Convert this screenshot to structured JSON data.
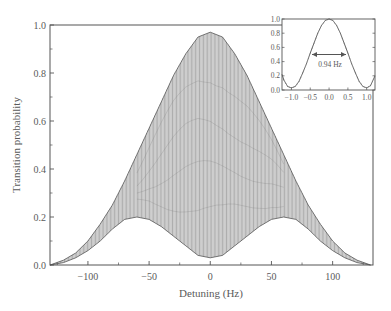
{
  "chart_data": [
    {
      "id": "main",
      "type": "line",
      "title": "",
      "xlabel": "Detuning (Hz)",
      "ylabel": "Transition probability",
      "xlim": [
        -131,
        133
      ],
      "ylim": [
        0.0,
        1.0
      ],
      "xticks": [
        -100,
        -50,
        0,
        50,
        100
      ],
      "xtick_labels": [
        "−100",
        "−50",
        "0",
        "50",
        "100"
      ],
      "yticks": [
        0.0,
        0.2,
        0.4,
        0.6,
        0.8,
        1.0
      ],
      "ytick_labels": [
        "0.0",
        "0.2",
        "0.4",
        "0.6",
        "0.8",
        "1.0"
      ],
      "grid": false,
      "legend": null,
      "description": "Rapidly oscillating transition probability between an upper and lower envelope",
      "upper_envelope": {
        "x": [
          -131,
          -120,
          -110,
          -100,
          -90,
          -80,
          -70,
          -60,
          -50,
          -40,
          -30,
          -20,
          -10,
          0,
          10,
          20,
          30,
          40,
          50,
          60,
          70,
          80,
          90,
          100,
          110,
          120,
          131
        ],
        "y": [
          0.0,
          0.02,
          0.05,
          0.1,
          0.17,
          0.25,
          0.35,
          0.46,
          0.57,
          0.68,
          0.79,
          0.88,
          0.95,
          0.97,
          0.95,
          0.88,
          0.79,
          0.68,
          0.57,
          0.46,
          0.35,
          0.25,
          0.17,
          0.1,
          0.05,
          0.02,
          0.0
        ]
      },
      "lower_envelope": {
        "x": [
          -131,
          -120,
          -110,
          -100,
          -90,
          -80,
          -70,
          -60,
          -50,
          -40,
          -30,
          -20,
          -10,
          0,
          10,
          20,
          30,
          40,
          50,
          60,
          70,
          80,
          90,
          100,
          110,
          120,
          131
        ],
        "y": [
          0.0,
          0.01,
          0.03,
          0.06,
          0.1,
          0.15,
          0.19,
          0.2,
          0.19,
          0.16,
          0.12,
          0.08,
          0.04,
          0.03,
          0.04,
          0.08,
          0.12,
          0.16,
          0.19,
          0.2,
          0.19,
          0.15,
          0.1,
          0.06,
          0.03,
          0.01,
          0.0
        ]
      }
    },
    {
      "id": "inset",
      "type": "line",
      "title": "",
      "xlabel": "",
      "ylabel": "",
      "xlim": [
        -1.25,
        1.22
      ],
      "ylim": [
        0.0,
        1.0
      ],
      "xticks": [
        -1.0,
        -0.5,
        0.0,
        0.5,
        1.0
      ],
      "xtick_labels": [
        "−1.0",
        "−0.5",
        "0.0",
        "0.5",
        "1.0"
      ],
      "yticks": [
        0.0,
        0.2,
        0.4,
        0.6,
        0.8,
        1.0
      ],
      "ytick_labels": [
        "0.0",
        "0.2",
        "0.4",
        "0.6",
        "0.8",
        "1.0"
      ],
      "series": [
        {
          "name": "transition probability (zoom)",
          "x": [
            -1.25,
            -1.2,
            -1.1,
            -1.0,
            -0.9,
            -0.8,
            -0.7,
            -0.6,
            -0.5,
            -0.4,
            -0.3,
            -0.2,
            -0.1,
            0.0,
            0.1,
            0.2,
            0.3,
            0.4,
            0.5,
            0.6,
            0.7,
            0.8,
            0.9,
            1.0,
            1.1,
            1.22
          ],
          "y": [
            0.22,
            0.14,
            0.05,
            0.03,
            0.05,
            0.12,
            0.24,
            0.37,
            0.52,
            0.66,
            0.8,
            0.91,
            0.98,
            1.0,
            0.98,
            0.91,
            0.8,
            0.66,
            0.52,
            0.37,
            0.24,
            0.12,
            0.05,
            0.03,
            0.06,
            0.2
          ]
        }
      ],
      "annotations": [
        {
          "type": "double-arrow",
          "x_from": -0.47,
          "x_to": 0.47,
          "y": 0.5,
          "label": "0.94 Hz"
        }
      ]
    }
  ]
}
